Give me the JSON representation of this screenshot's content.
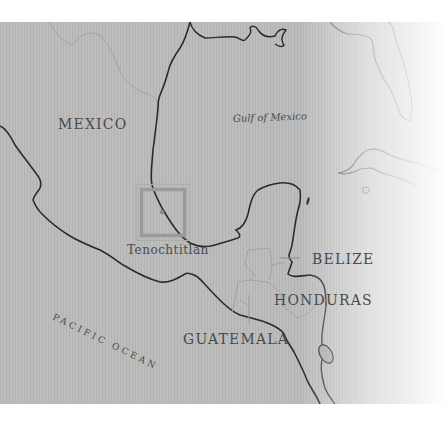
{
  "map": {
    "style": "grayscale historical map, right edge fading to white",
    "colors": {
      "land_and_sea": "#bdbdbd",
      "coastline": "#2b2b2b",
      "border": "#a8a8a8",
      "label_text": "#4a4a4a",
      "highlight_box": "#9a9a9a",
      "highlight_box_outer": "#b0b0b0"
    },
    "labels": {
      "mexico": "MEXICO",
      "gulf": "Gulf of Mexico",
      "city": "Tenochtitlan",
      "belize": "BELIZE",
      "honduras": "HONDURAS",
      "guatemala": "GUATEMALA",
      "pacific": "PACIFIC OCEAN"
    },
    "highlight": {
      "name": "Tenochtitlan locator box",
      "marker": "dot"
    }
  }
}
